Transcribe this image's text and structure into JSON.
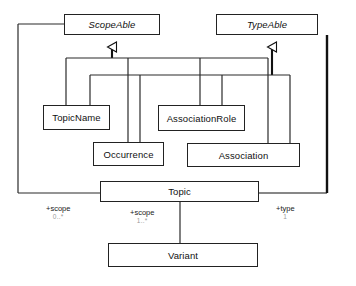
{
  "diagram": {
    "type": "uml-class-diagram",
    "background_color": "#ffffff",
    "line_color": "#222222",
    "box_fill": "#ffffff"
  },
  "classes": [
    {
      "id": "scopeable",
      "name": "ScopeAble",
      "abstract": true,
      "x": 64,
      "y": 14,
      "w": 96,
      "h": 21
    },
    {
      "id": "typeable",
      "name": "TypeAble",
      "abstract": true,
      "x": 216,
      "y": 14,
      "w": 102,
      "h": 21
    },
    {
      "id": "topicname",
      "name": "TopicName",
      "abstract": false,
      "x": 43,
      "y": 105,
      "w": 67,
      "h": 25
    },
    {
      "id": "associationrole",
      "name": "AssociationRole",
      "abstract": false,
      "x": 158,
      "y": 105,
      "w": 87,
      "h": 26
    },
    {
      "id": "occurrence",
      "name": "Occurrence",
      "abstract": false,
      "x": 93,
      "y": 142,
      "w": 71,
      "h": 24
    },
    {
      "id": "association",
      "name": "Association",
      "abstract": false,
      "x": 187,
      "y": 143,
      "w": 113,
      "h": 24
    },
    {
      "id": "topic",
      "name": "Topic",
      "abstract": false,
      "x": 100,
      "y": 181,
      "w": 159,
      "h": 21
    },
    {
      "id": "variant",
      "name": "Variant",
      "abstract": false,
      "x": 108,
      "y": 243,
      "w": 150,
      "h": 24
    }
  ],
  "generalizations": [
    {
      "from": "topicname",
      "to": "scopeable"
    },
    {
      "from": "occurrence",
      "to": "scopeable"
    },
    {
      "from": "associationrole",
      "to": "scopeable"
    },
    {
      "from": "association",
      "to": "scopeable"
    },
    {
      "from": "occurrence",
      "to": "typeable"
    },
    {
      "from": "associationrole",
      "to": "typeable"
    },
    {
      "from": "association",
      "to": "typeable"
    },
    {
      "from": "topicname",
      "to": "typeable"
    }
  ],
  "associations": [
    {
      "id": "scope-left",
      "source": "topic",
      "target": "scopeable",
      "role": "+scope",
      "multiplicity": "0..*",
      "label_x": 46,
      "label_y": 204
    },
    {
      "id": "scope-variant",
      "source": "topic",
      "target": "variant",
      "role": "+scope",
      "multiplicity": "1..*",
      "label_x": 130,
      "label_y": 208
    },
    {
      "id": "type-right",
      "source": "topic",
      "target": "typeable",
      "role": "+type",
      "multiplicity": "1",
      "label_x": 276,
      "label_y": 204
    }
  ]
}
